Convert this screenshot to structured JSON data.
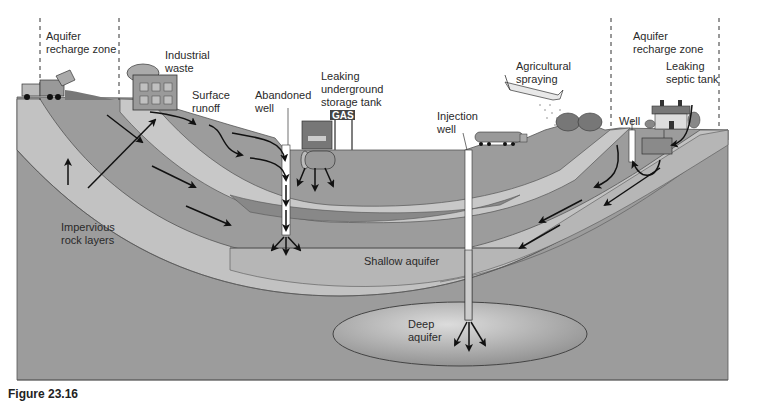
{
  "figure": {
    "caption": "Figure 23.16"
  },
  "labels": {
    "recharge_left": "Aquifer\nrecharge zone",
    "industrial": "Industrial\nwaste",
    "surface_runoff": "Surface\nrunoff",
    "abandoned_well": "Abandoned\nwell",
    "leaking_tank": "Leaking\nunderground\nstorage tank",
    "gas_sign": "GAS",
    "injection_well": "Injection\nwell",
    "agricultural": "Agricultural\nspraying",
    "recharge_right": "Aquifer\nrecharge zone",
    "septic": "Leaking\nseptic tank",
    "well": "Well",
    "impervious": "Impervious\nrock layers",
    "shallow": "Shallow aquifer",
    "deep": "Deep\naquifer"
  },
  "colors": {
    "ground": "#9a9a9a",
    "layer_light": "#c4c4c4",
    "layer_dark": "#8a8a8a",
    "aquifer_shallow": "#b4b4b4",
    "aquifer_deep": "#a8a8a8",
    "line": "#1a1a1a"
  }
}
